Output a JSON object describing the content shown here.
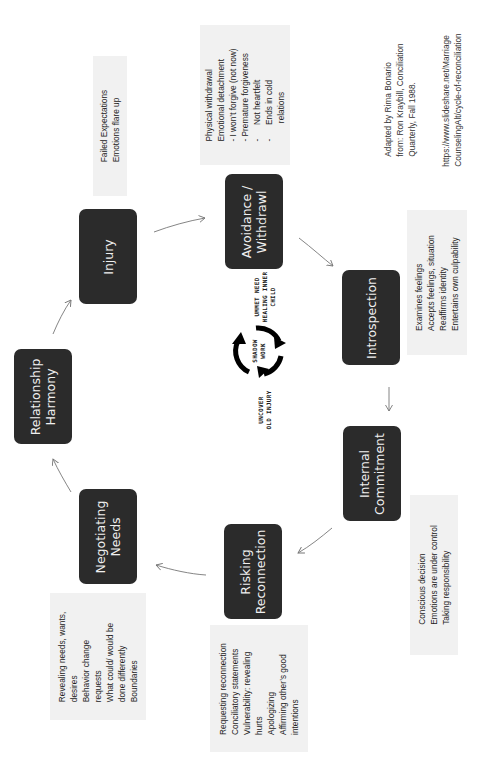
{
  "diagram": {
    "orientation": "rotated -90deg (text reads bottom-to-top)",
    "stages": [
      {
        "id": "relationship-harmony",
        "label_lines": [
          "Relationship",
          "Harmony"
        ]
      },
      {
        "id": "injury",
        "label_lines": [
          "Injury"
        ]
      },
      {
        "id": "avoidance-withdrawal",
        "label_lines": [
          "Avoidance /",
          "Withdrawl"
        ]
      },
      {
        "id": "introspection",
        "label_lines": [
          "Introspection"
        ]
      },
      {
        "id": "internal-commitment",
        "label_lines": [
          "Internal",
          "Commitment"
        ]
      },
      {
        "id": "risking-reconnection",
        "label_lines": [
          "Risking",
          "Reconnection"
        ]
      },
      {
        "id": "negotiating-needs",
        "label_lines": [
          "Negotiating",
          "Needs"
        ]
      }
    ],
    "notes": {
      "injury": [
        "Failed Expectations",
        "Emotions flare up"
      ],
      "avoidance": [
        "Physical withdrawal",
        "Emotional detachment",
        "- I won’t forgive (not now)",
        "- Premature forgiveness",
        "-      Not heartfelt",
        "-      Ends in cold",
        "        relations"
      ],
      "introspection": [
        "Examines feelings",
        "Accepts feelings, situation",
        "Reaffirms identity",
        "Entertains own culpability"
      ],
      "internal_commitment": [
        "Conscious decision",
        "Emotions are under control",
        "Taking responsibility"
      ],
      "risking_reconnection": [
        "Requesting reconnection",
        "Conciliatory statements",
        "Vulnerability: revealing",
        "hurts",
        "Apologizing",
        "Affirming other’s good",
        "intentions"
      ],
      "negotiating_needs": [
        "Revealing needs, wants,",
        "desires",
        "Behavior change",
        "requests",
        "What could/ would be",
        "done differently",
        "Boundaries"
      ]
    },
    "shadow_work": {
      "center_lines": [
        "SHADOW",
        "WORK"
      ],
      "top_lines": [
        "UMMET NEED",
        "HEALING INNER",
        "CHILD"
      ],
      "bottom_lines": [
        "UNCOVER",
        "OLD INJURY"
      ]
    },
    "credit": {
      "lines": [
        "Adapted by Rima Bonario",
        "from: Ron Kraybill, Conciliation",
        "Quarterly, Fall 1988."
      ],
      "url_lines": [
        "https://www.slideshare.net/Marriage",
        "CounselingAlt/cycle-of-reconciliation"
      ]
    },
    "colors": {
      "box_fill": "#2b2b2b",
      "box_text": "#f0f0f0",
      "note_fill": "#f1f1f1",
      "note_text": "#222222",
      "arrow": "#777777",
      "cycle_icon": "#000000"
    }
  }
}
